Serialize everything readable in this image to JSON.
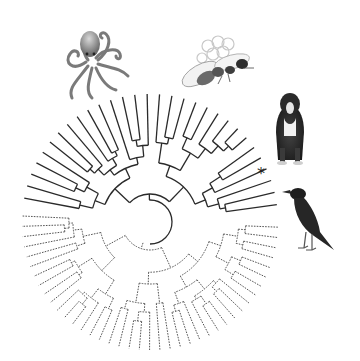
{
  "figure": {
    "type": "circular-phylogenetic-tree",
    "center": [
      150,
      222
    ],
    "inner_radius": 22,
    "outer_radius": 128,
    "solid_clade": {
      "start_deg": 188,
      "end_deg": 355,
      "tips": 30,
      "color": "#2a2a2a",
      "style": "solid"
    },
    "dotted_clade": {
      "start_deg": 0,
      "end_deg": 185,
      "tips": 40,
      "color": "#555555",
      "style": "dotted"
    },
    "highlight_marker": {
      "label": "*",
      "position": [
        257,
        168
      ]
    }
  },
  "illustrations": [
    {
      "name": "octopus",
      "position": [
        50,
        28
      ],
      "size": [
        80,
        62
      ]
    },
    {
      "name": "honeybee",
      "position": [
        183,
        30
      ],
      "size": [
        82,
        68
      ]
    },
    {
      "name": "bernese-mountain-dog",
      "position": [
        270,
        96
      ],
      "size": [
        40,
        72
      ]
    },
    {
      "name": "crow",
      "position": [
        282,
        185
      ],
      "size": [
        56,
        70
      ]
    }
  ]
}
